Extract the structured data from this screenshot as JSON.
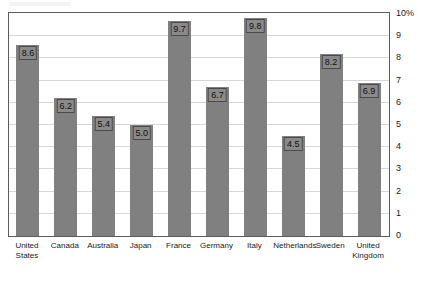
{
  "chart_data": {
    "type": "bar",
    "title": "",
    "xlabel": "",
    "ylabel": "",
    "ylim": [
      0,
      10
    ],
    "grid": true,
    "legend": "none",
    "y_unit": "%",
    "y_tick_labels": [
      "10%",
      "9",
      "8",
      "7",
      "6",
      "5",
      "4",
      "3",
      "2",
      "1",
      "0"
    ],
    "y_tick_values": [
      10,
      9,
      8,
      7,
      6,
      5,
      4,
      3,
      2,
      1,
      0
    ],
    "categories": [
      "United States",
      "Canada",
      "Australia",
      "Japan",
      "France",
      "Germany",
      "Italy",
      "Netherlands",
      "Sweden",
      "United Kingdom"
    ],
    "category_lines": [
      [
        "United",
        "States"
      ],
      [
        "Canada"
      ],
      [
        "Australia"
      ],
      [
        "Japan"
      ],
      [
        "France"
      ],
      [
        "Germany"
      ],
      [
        "Italy"
      ],
      [
        "Netherlands"
      ],
      [
        "Sweden"
      ],
      [
        "United",
        "Kingdom"
      ]
    ],
    "values": [
      8.6,
      6.2,
      5.4,
      5.0,
      9.7,
      6.7,
      9.8,
      4.5,
      8.2,
      6.9
    ],
    "value_labels": [
      "8.6",
      "6.2",
      "5.4",
      "5.0",
      "9.7",
      "6.7",
      "9.8",
      "4.5",
      "8.2",
      "6.9"
    ]
  },
  "style": {
    "bar_color": "#808080",
    "label_fill": "#8a8a8a",
    "label_border": "#4a4a4a",
    "frame_color": "#5c5c5c",
    "gridline_color": "#d8d8d8",
    "background": "#ffffff",
    "text_color": "#1a1a1a"
  }
}
